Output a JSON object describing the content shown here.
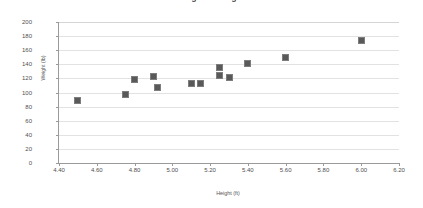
{
  "chart_data": {
    "type": "scatter",
    "title": "Height vs Weight",
    "xlabel": "Height (ft)",
    "ylabel": "Weight (lb)",
    "xlim": [
      4.4,
      6.2
    ],
    "ylim": [
      0,
      200
    ],
    "x_ticks": [
      "4.40",
      "4.60",
      "4.80",
      "5.00",
      "5.20",
      "5.40",
      "5.60",
      "5.80",
      "6.00",
      "6.20"
    ],
    "x_tick_values": [
      4.4,
      4.6,
      4.8,
      5.0,
      5.2,
      5.4,
      5.6,
      5.8,
      6.0,
      6.2
    ],
    "y_ticks": [
      "0",
      "20",
      "40",
      "60",
      "80",
      "100",
      "120",
      "140",
      "160",
      "180",
      "200"
    ],
    "y_tick_values": [
      0,
      20,
      40,
      60,
      80,
      100,
      120,
      140,
      160,
      180,
      200
    ],
    "grid": "horizontal",
    "legend": "none",
    "marker": "square",
    "marker_color": "#595959",
    "points": [
      {
        "x": 4.5,
        "y": 88
      },
      {
        "x": 4.75,
        "y": 97
      },
      {
        "x": 4.8,
        "y": 118
      },
      {
        "x": 4.9,
        "y": 122
      },
      {
        "x": 4.92,
        "y": 107
      },
      {
        "x": 5.1,
        "y": 113
      },
      {
        "x": 5.15,
        "y": 113
      },
      {
        "x": 5.25,
        "y": 135
      },
      {
        "x": 5.25,
        "y": 124
      },
      {
        "x": 5.3,
        "y": 121
      },
      {
        "x": 5.4,
        "y": 141
      },
      {
        "x": 5.6,
        "y": 150
      },
      {
        "x": 6.0,
        "y": 174
      }
    ]
  }
}
